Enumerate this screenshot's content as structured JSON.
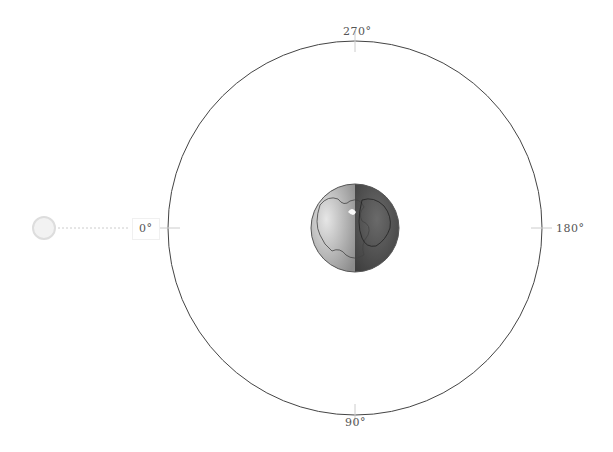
{
  "diagram": {
    "title": "",
    "orbit": {
      "cx": 355,
      "cy": 228,
      "r": 187,
      "stroke": "#333333"
    },
    "angle_labels": [
      {
        "text": "270°",
        "position": "top"
      },
      {
        "text": "180°",
        "position": "right"
      },
      {
        "text": "90°",
        "position": "bottom"
      },
      {
        "text": "0°",
        "position": "left"
      }
    ],
    "earth": {
      "cx": 355,
      "cy": 228,
      "r": 44,
      "day_color": "#b8b8b8",
      "night_color": "#555555"
    },
    "sun": {
      "cx": 44,
      "cy": 228,
      "r": 11,
      "color": "#e8e8e8"
    }
  }
}
